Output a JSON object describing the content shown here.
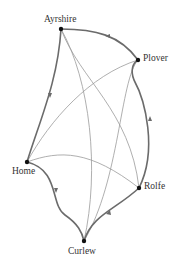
{
  "diagram": {
    "type": "directed-graph",
    "nodes": [
      {
        "id": "ayrshire",
        "label": "Ayrshire"
      },
      {
        "id": "plover",
        "label": "Plover"
      },
      {
        "id": "home",
        "label": "Home"
      },
      {
        "id": "rolfe",
        "label": "Rolfe"
      },
      {
        "id": "curlew",
        "label": "Curlew"
      }
    ],
    "cycle_edges": [
      {
        "from": "Ayrshire",
        "to": "Home"
      },
      {
        "from": "Home",
        "to": "Curlew"
      },
      {
        "from": "Curlew",
        "to": "Rolfe"
      },
      {
        "from": "Rolfe",
        "to": "Plover"
      },
      {
        "from": "Plover",
        "to": "Ayrshire"
      }
    ],
    "chord_edges": [
      {
        "from": "Ayrshire",
        "to": "Curlew"
      },
      {
        "from": "Ayrshire",
        "to": "Rolfe"
      },
      {
        "from": "Plover",
        "to": "Home"
      },
      {
        "from": "Plover",
        "to": "Curlew"
      },
      {
        "from": "Home",
        "to": "Rolfe"
      }
    ],
    "colors": {
      "thick_edge": "#6b6b6b",
      "thin_edge": "#9a9a9a",
      "node": "#111111"
    }
  }
}
